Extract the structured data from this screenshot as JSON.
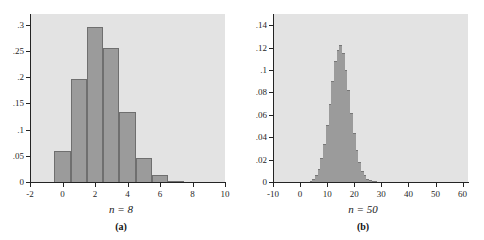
{
  "figure": {
    "background_color": "#ffffff",
    "plot_background_color": "#e3e3e3",
    "bar_color": "#9b9b9b",
    "bar_edge_color": "#6f6f6f",
    "axis_color": "#242424"
  },
  "panels": [
    {
      "id": "a",
      "caption": "(a)",
      "n_label": "n = 8",
      "chart_data": {
        "type": "bar",
        "title": "",
        "subtitle": "",
        "xlabel": "n = 8",
        "ylabel": "",
        "grid": false,
        "legend": "none",
        "xlim": [
          -2,
          10
        ],
        "ylim": [
          0,
          0.32
        ],
        "xticks": [
          -2,
          0,
          2,
          4,
          6,
          8,
          10
        ],
        "xtick_labels": [
          "-2",
          "0",
          "2",
          "4",
          "6",
          "8",
          "10"
        ],
        "yticks": [
          0,
          0.05,
          0.1,
          0.15,
          0.2,
          0.25,
          0.3
        ],
        "ytick_labels": [
          "0",
          ".05",
          ".1",
          ".15",
          ".2",
          ".25",
          ".3"
        ],
        "bar_width": 1,
        "categories": [
          0,
          1,
          2,
          3,
          4,
          5,
          6,
          7
        ],
        "values": [
          0.059,
          0.197,
          0.295,
          0.255,
          0.134,
          0.045,
          0.013,
          0.002
        ]
      }
    },
    {
      "id": "b",
      "caption": "(b)",
      "n_label": "n = 50",
      "chart_data": {
        "type": "bar",
        "title": "",
        "subtitle": "",
        "xlabel": "n = 50",
        "ylabel": "",
        "grid": false,
        "legend": "none",
        "xlim": [
          -10,
          62
        ],
        "ylim": [
          0,
          0.15
        ],
        "xticks": [
          -10,
          0,
          10,
          20,
          30,
          40,
          50,
          60
        ],
        "xtick_labels": [
          "-10",
          "0",
          "10",
          "20",
          "30",
          "40",
          "50",
          "60"
        ],
        "yticks": [
          0,
          0.02,
          0.04,
          0.06,
          0.08,
          0.1,
          0.12,
          0.14
        ],
        "ytick_labels": [
          "0",
          ".02",
          ".04",
          ".06",
          ".08",
          ".1",
          ".12",
          ".14"
        ],
        "bar_width": 1,
        "categories": [
          4,
          5,
          6,
          7,
          8,
          9,
          10,
          11,
          12,
          13,
          14,
          15,
          16,
          17,
          18,
          19,
          20,
          21,
          22,
          23,
          24,
          25,
          26,
          27,
          28
        ],
        "values": [
          0.001,
          0.003,
          0.006,
          0.012,
          0.021,
          0.034,
          0.051,
          0.07,
          0.09,
          0.108,
          0.118,
          0.122,
          0.115,
          0.1,
          0.082,
          0.062,
          0.044,
          0.029,
          0.018,
          0.01,
          0.006,
          0.003,
          0.0015,
          0.0007,
          0.0003
        ]
      }
    }
  ]
}
